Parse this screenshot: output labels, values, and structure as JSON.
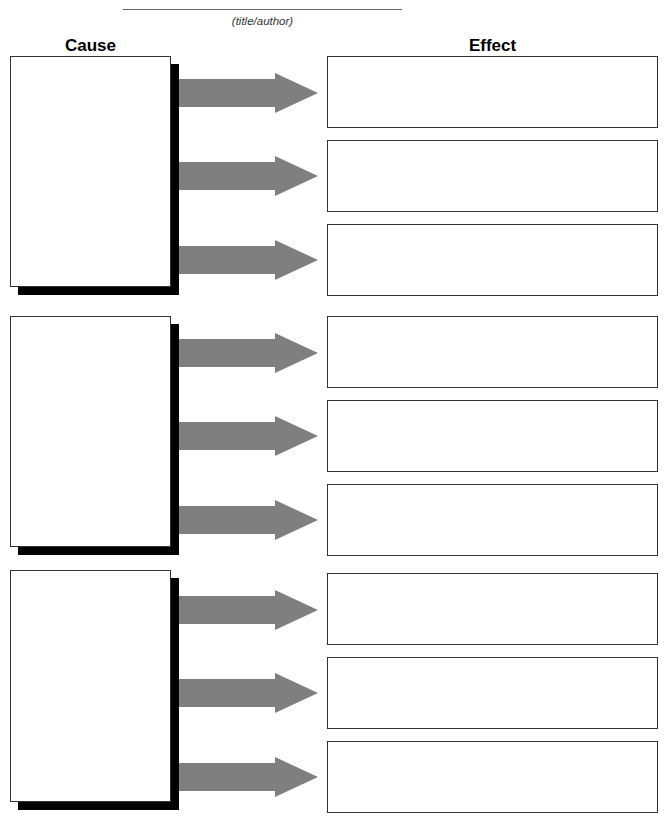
{
  "header": {
    "title_caption": "(title/author)"
  },
  "columns": {
    "cause_label": "Cause",
    "effect_label": "Effect"
  },
  "colors": {
    "arrow": "#7f7f7f",
    "shadow": "#000000",
    "border": "#333333"
  },
  "groups": [
    {
      "cause": {
        "text": ""
      },
      "effects": [
        {
          "text": ""
        },
        {
          "text": ""
        },
        {
          "text": ""
        }
      ]
    },
    {
      "cause": {
        "text": ""
      },
      "effects": [
        {
          "text": ""
        },
        {
          "text": ""
        },
        {
          "text": ""
        }
      ]
    },
    {
      "cause": {
        "text": ""
      },
      "effects": [
        {
          "text": ""
        },
        {
          "text": ""
        },
        {
          "text": ""
        }
      ]
    }
  ]
}
